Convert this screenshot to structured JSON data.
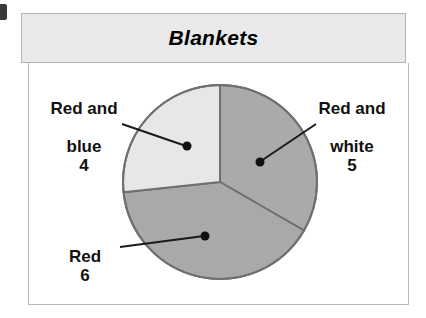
{
  "chart_data": {
    "type": "pie",
    "title": "Blankets",
    "categories": [
      "Red and blue",
      "Red and white",
      "Red"
    ],
    "values": [
      4,
      5,
      6
    ],
    "total": 15,
    "xlabel": "",
    "ylabel": "",
    "legend_position": "callout-labels",
    "grid": false,
    "slices": [
      {
        "label": "Red and blue",
        "label_line1": "Red and",
        "label_line2": "blue",
        "value": 4,
        "value_text": "4",
        "color": "#e7e7e7",
        "start_angle_deg": 144,
        "sweep_deg": 96
      },
      {
        "label": "Red and white",
        "label_line1": "Red and",
        "label_line2": "white",
        "value": 5,
        "value_text": "5",
        "color": "#aaaaaa",
        "start_angle_deg": 0,
        "sweep_deg": 120
      },
      {
        "label": "Red",
        "label_line1": "Red",
        "label_line2": "",
        "value": 6,
        "value_text": "6",
        "color": "#a9a9a9",
        "start_angle_deg": 120,
        "sweep_deg": 144
      }
    ]
  },
  "chart": {
    "title": "Blankets",
    "frame_color": "#b4b4b4",
    "title_bar_color": "#e9e9e9",
    "panel_color": "#ffffff",
    "outline_color": "#6f6f6f",
    "leader_color": "#1a1a1a"
  },
  "labels": {
    "red_and_blue": {
      "line1": "Red and",
      "line2": "blue",
      "value": "4"
    },
    "red_and_white": {
      "line1": "Red and",
      "line2": "white",
      "value": "5"
    },
    "red": {
      "line1": "Red",
      "value": "6"
    }
  }
}
